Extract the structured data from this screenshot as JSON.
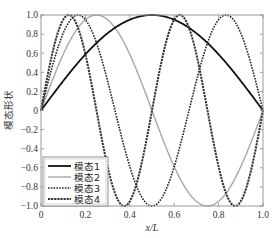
{
  "chart_data": {
    "type": "line",
    "title": "",
    "xlabel": "x/L",
    "ylabel": "模态形状",
    "xlim": [
      0,
      1.0
    ],
    "ylim": [
      -1.0,
      1.0
    ],
    "xticks": [
      "0",
      "0.2",
      "0.4",
      "0.6",
      "0.8",
      "1.0"
    ],
    "xtick_values": [
      0,
      0.2,
      0.4,
      0.6,
      0.8,
      1.0
    ],
    "yticks": [
      "-1.0",
      "-0.8",
      "-0.6",
      "-0.4",
      "-0.2",
      "0",
      "0.2",
      "0.4",
      "0.6",
      "0.8",
      "1.0"
    ],
    "ytick_values": [
      -1.0,
      -0.8,
      -0.6,
      -0.4,
      -0.2,
      0,
      0.2,
      0.4,
      0.6,
      0.8,
      1.0
    ],
    "grid": false,
    "legend_position": "lower left",
    "series": [
      {
        "name": "模态1",
        "formula": "sin(1*pi*x)",
        "mode": 1,
        "color": "#111111",
        "style": "solid",
        "width": 1.8,
        "x": [
          0,
          0.1,
          0.2,
          0.3,
          0.4,
          0.5,
          0.6,
          0.7,
          0.8,
          0.9,
          1.0
        ],
        "values": [
          0,
          0.309,
          0.588,
          0.809,
          0.951,
          1.0,
          0.951,
          0.809,
          0.588,
          0.309,
          0
        ]
      },
      {
        "name": "模态2",
        "formula": "sin(2*pi*x)",
        "mode": 2,
        "color": "#a8a8a8",
        "style": "solid",
        "width": 1.4,
        "x": [
          0,
          0.125,
          0.25,
          0.375,
          0.5,
          0.625,
          0.75,
          0.875,
          1.0
        ],
        "values": [
          0,
          0.707,
          1.0,
          0.707,
          0,
          -0.707,
          -1.0,
          -0.707,
          0
        ]
      },
      {
        "name": "模态3",
        "formula": "sin(3*pi*x)",
        "mode": 3,
        "color": "#222222",
        "style": "dotted",
        "width": 1.6,
        "x": [
          0,
          0.1667,
          0.3333,
          0.5,
          0.6667,
          0.8333,
          1.0
        ],
        "values": [
          0,
          1.0,
          0,
          -1.0,
          0,
          1.0,
          0
        ]
      },
      {
        "name": "模态4",
        "formula": "sin(4*pi*x)",
        "mode": 4,
        "color": "#333333",
        "style": "dashdot",
        "width": 2.0,
        "x": [
          0,
          0.125,
          0.25,
          0.375,
          0.5,
          0.625,
          0.75,
          0.875,
          1.0
        ],
        "values": [
          0,
          1.0,
          0,
          -1.0,
          0,
          1.0,
          0,
          -1.0,
          0
        ]
      }
    ]
  },
  "plot": {
    "left": 41,
    "top": 15,
    "right": 263,
    "bottom": 206
  },
  "legend": {
    "items": [
      {
        "label": "模态1"
      },
      {
        "label": "模态2"
      },
      {
        "label": "模态3"
      },
      {
        "label": "模态4"
      }
    ]
  }
}
